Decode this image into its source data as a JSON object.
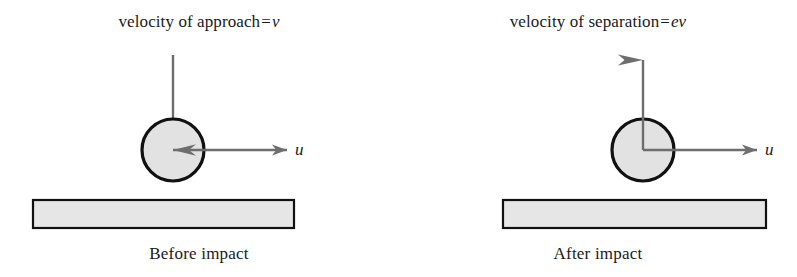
{
  "figure": {
    "type": "physics-diagram",
    "width": 797,
    "height": 277,
    "background_color": "#ffffff"
  },
  "style": {
    "ball_fill": "#e2e2e2",
    "ball_stroke": "#111111",
    "ball_stroke_width": 3.2,
    "ball_radius": 31,
    "block_fill": "#e6e6e6",
    "block_stroke": "#111111",
    "block_stroke_width": 2.2,
    "arrow_color": "#6e6e6e",
    "arrow_width": 2.4,
    "text_color": "#1a1a1a"
  },
  "panels": [
    {
      "id": "before",
      "caption": "Before impact",
      "velocity_label": {
        "prefix": "velocity of approach",
        "equals": "=",
        "value": "v",
        "full_text": "velocity of approach = v"
      },
      "ball": {
        "cx": 173,
        "cy": 150,
        "r": 31
      },
      "velocity_arrow": {
        "name": "approach-velocity-arrow",
        "direction": "down",
        "from_x": 173,
        "from_y": 55,
        "to_x": 173,
        "to_y": 150,
        "label": "v"
      },
      "horizontal_arrow": {
        "name": "horizontal-velocity-arrow",
        "direction": "right",
        "from_x": 173,
        "from_y": 150,
        "to_x": 287,
        "to_y": 150,
        "label": "u"
      },
      "ground_block": {
        "x": 33,
        "y": 200,
        "width": 261,
        "height": 28
      }
    },
    {
      "id": "after",
      "caption": "After impact",
      "velocity_label": {
        "prefix": "velocity of separation",
        "equals": "=",
        "value": "ev",
        "full_text": "velocity of separation = ev"
      },
      "ball": {
        "cx": 244,
        "cy": 150,
        "r": 31
      },
      "velocity_arrow": {
        "name": "separation-velocity-arrow",
        "direction": "up",
        "from_x": 244,
        "from_y": 150,
        "to_x": 244,
        "to_y": 60,
        "label": "ev"
      },
      "horizontal_arrow": {
        "name": "horizontal-velocity-arrow",
        "direction": "right",
        "from_x": 244,
        "from_y": 150,
        "to_x": 358,
        "to_y": 150,
        "label": "u"
      },
      "ground_block": {
        "x": 104,
        "y": 200,
        "width": 263,
        "height": 28
      }
    }
  ],
  "axis_letters": {
    "before": "u",
    "after": "u"
  }
}
